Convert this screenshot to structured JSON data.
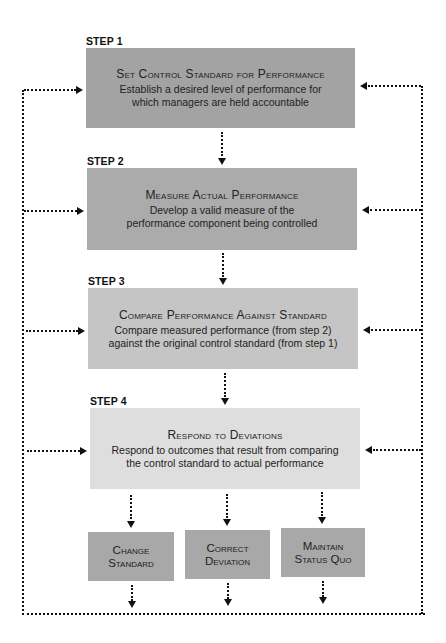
{
  "diagram": {
    "steps": [
      {
        "label": "STEP 1",
        "title": "Set Control Standard for Performance",
        "desc": "Establish a desired level of performance for which managers are held accountable",
        "color": "#a3a3a3"
      },
      {
        "label": "STEP 2",
        "title": "Measure Actual Performance",
        "desc": "Develop a valid measure of the performance component being controlled",
        "color": "#ababab"
      },
      {
        "label": "STEP 3",
        "title": "Compare Performance Against Standard",
        "desc": "Compare measured performance (from step 2) against the original control standard (from step 1)",
        "color": "#c5c5c5"
      },
      {
        "label": "STEP 4",
        "title": "Respond to Deviations",
        "desc": "Respond to outcomes that result from comparing the control standard to actual performance",
        "color": "#dedede"
      }
    ],
    "outcomes": [
      {
        "line1": "Change",
        "line2": "Standard"
      },
      {
        "line1": "Correct",
        "line2": "Deviation"
      },
      {
        "line1": "Maintain",
        "line2": "Status Quo"
      }
    ],
    "outcome_color": "#a8a8a8",
    "connector_color": "#111111"
  }
}
